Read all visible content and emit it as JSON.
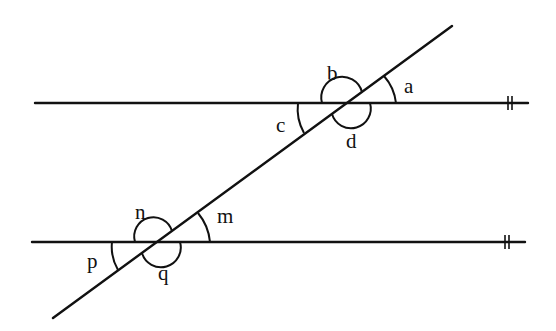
{
  "diagram": {
    "lines": {
      "top_parallel": {
        "x1": 35,
        "y1": 103,
        "x2": 528,
        "y2": 103
      },
      "bottom_parallel": {
        "x1": 32,
        "y1": 242,
        "x2": 525,
        "y2": 242
      },
      "transversal": {
        "x1": 53,
        "y1": 318,
        "x2": 452,
        "y2": 26
      }
    },
    "parallel_marker": "||",
    "labels": {
      "a": "a",
      "b": "b",
      "c": "c",
      "d": "d",
      "m": "m",
      "n": "n",
      "p": "p",
      "q": "q"
    }
  }
}
